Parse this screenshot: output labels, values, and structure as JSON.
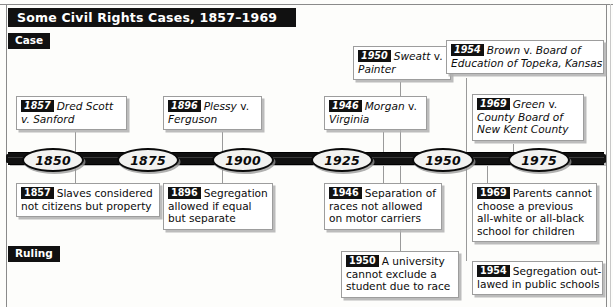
{
  "title": "Some Civil Rights Cases, 1857–1969",
  "sections": {
    "case_label": "Case",
    "ruling_label": "Ruling"
  },
  "timeline": {
    "years": [
      "1850",
      "1875",
      "1900",
      "1925",
      "1950",
      "1975"
    ],
    "range_start": "1850",
    "range_end": "1975"
  },
  "cases": [
    {
      "year": "1857",
      "line1": "Dred Scott",
      "line2": "v. Sanford",
      "line3": ""
    },
    {
      "year": "1896",
      "line1": "Plessy",
      "line1b": "v.",
      "line2": "Ferguson",
      "line3": ""
    },
    {
      "year": "1946",
      "line1": "Morgan",
      "line1b": "v.",
      "line2": "Virginia",
      "line3": ""
    },
    {
      "year": "1950",
      "line1": "Sweatt",
      "line1b": "v.",
      "line2": "Painter",
      "line3": ""
    },
    {
      "year": "1954",
      "line1": "Brown",
      "line1b": "v.",
      "line1c": "Board of",
      "line2": "Education of Topeka, Kansas",
      "line3": ""
    },
    {
      "year": "1969",
      "line1": "Green",
      "line1b": "v.",
      "line2": "County Board of",
      "line3": "New Kent County"
    }
  ],
  "rulings": [
    {
      "year": "1857",
      "line1": "Slaves considered",
      "line2": "not citizens but property",
      "line3": "",
      "line4": ""
    },
    {
      "year": "1896",
      "line1": "Segregation",
      "line2": "allowed if equal",
      "line3": "but separate",
      "line4": ""
    },
    {
      "year": "1946",
      "line1": "Separation of",
      "line2": "races not allowed",
      "line3": "on motor carriers",
      "line4": ""
    },
    {
      "year": "1950",
      "line1": "A university",
      "line2": "cannot exclude a",
      "line3": "student due to race",
      "line4": ""
    },
    {
      "year": "1969",
      "line1": "Parents cannot",
      "line2": "choose a previous",
      "line3": "all-white or all-black",
      "line4": "school for children"
    },
    {
      "year": "1954",
      "line1": "Segregation out-",
      "line2": "lawed in public schools",
      "line3": "",
      "line4": ""
    }
  ],
  "colors": {
    "banner": "#111111",
    "banner_text": "#ffffff",
    "box_border": "#9d9d9d",
    "box_shadow": "#b0b0b0",
    "page": "#fdfdfb",
    "oval_fill": "#f2f2f0"
  }
}
